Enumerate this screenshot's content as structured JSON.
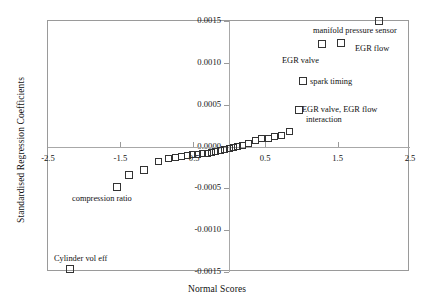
{
  "chart_data": {
    "type": "scatter",
    "title": "",
    "xlabel": "Normal Scores",
    "ylabel": "Standardised Regression Coefficients",
    "xlim": [
      -2.5,
      2.5
    ],
    "ylim": [
      -0.0015,
      0.0015
    ],
    "xticks": [
      "-2.5",
      "-1.5",
      "-0.5",
      "0.5",
      "1.5",
      "2.5"
    ],
    "xtick_values": [
      -2.5,
      -1.5,
      -0.5,
      0.5,
      1.5,
      2.5
    ],
    "yticks": [
      "0.0015",
      "0.0010",
      "0.0005",
      "0.0000",
      "-0.0005",
      "-0.0010",
      "-0.0015"
    ],
    "ytick_values": [
      0.0015,
      0.001,
      0.0005,
      0.0,
      -0.0005,
      -0.001,
      -0.0015
    ],
    "grid": false,
    "legend": "none",
    "marker": "open-square",
    "points": [
      {
        "x": -2.2,
        "y": -0.00147,
        "label": "Cylinder vol eff"
      },
      {
        "x": -1.55,
        "y": -0.00049,
        "label": "compression ratio"
      },
      {
        "x": -1.38,
        "y": -0.00034,
        "label": ""
      },
      {
        "x": -1.18,
        "y": -0.00028,
        "label": ""
      },
      {
        "x": -0.98,
        "y": -0.00018,
        "label": ""
      },
      {
        "x": -0.84,
        "y": -0.00014,
        "label": ""
      },
      {
        "x": -0.74,
        "y": -0.00013,
        "label": ""
      },
      {
        "x": -0.66,
        "y": -0.00012,
        "label": ""
      },
      {
        "x": -0.58,
        "y": -0.00011,
        "label": ""
      },
      {
        "x": -0.5,
        "y": -0.0001,
        "label": ""
      },
      {
        "x": -0.43,
        "y": -9e-05,
        "label": ""
      },
      {
        "x": -0.36,
        "y": -8e-05,
        "label": ""
      },
      {
        "x": -0.3,
        "y": -8e-05,
        "label": ""
      },
      {
        "x": -0.24,
        "y": -7e-05,
        "label": ""
      },
      {
        "x": -0.18,
        "y": -6e-05,
        "label": ""
      },
      {
        "x": -0.12,
        "y": -5e-05,
        "label": ""
      },
      {
        "x": -0.06,
        "y": -4e-05,
        "label": ""
      },
      {
        "x": 0.0,
        "y": -2e-05,
        "label": ""
      },
      {
        "x": 0.06,
        "y": -1e-05,
        "label": ""
      },
      {
        "x": 0.12,
        "y": 0.0,
        "label": ""
      },
      {
        "x": 0.19,
        "y": 1e-05,
        "label": ""
      },
      {
        "x": 0.27,
        "y": 4e-05,
        "label": ""
      },
      {
        "x": 0.36,
        "y": 7e-05,
        "label": ""
      },
      {
        "x": 0.45,
        "y": 9e-05,
        "label": ""
      },
      {
        "x": 0.54,
        "y": 0.0001,
        "label": ""
      },
      {
        "x": 0.63,
        "y": 0.00012,
        "label": ""
      },
      {
        "x": 0.72,
        "y": 0.00013,
        "label": ""
      },
      {
        "x": 0.84,
        "y": 0.00018,
        "label": ""
      },
      {
        "x": 0.96,
        "y": 0.00044,
        "label": "EGR valve, EGR flow interaction"
      },
      {
        "x": 1.02,
        "y": 0.00078,
        "label": "spark timing"
      },
      {
        "x": 1.28,
        "y": 0.00122,
        "label": "EGR valve"
      },
      {
        "x": 1.55,
        "y": 0.00124,
        "label": "EGR flow"
      },
      {
        "x": 2.07,
        "y": 0.0015,
        "label": "manifold pressure sensor"
      }
    ],
    "annotations": [
      {
        "text": "manifold pressure sensor",
        "x": 2.07,
        "y": 0.0015
      },
      {
        "text": "EGR flow",
        "x": 1.55,
        "y": 0.00124
      },
      {
        "text": "EGR valve",
        "x": 1.28,
        "y": 0.00122
      },
      {
        "text": "spark timing",
        "x": 1.02,
        "y": 0.00078
      },
      {
        "text": "EGR valve, EGR flow interaction",
        "x": 0.96,
        "y": 0.00044
      },
      {
        "text": "compression ratio",
        "x": -1.55,
        "y": -0.00049
      },
      {
        "text": "Cylinder vol eff",
        "x": -2.2,
        "y": -0.00147
      }
    ]
  },
  "labels": {
    "ylabel": "Standardised Regression Coefficients",
    "xlabel": "Normal Scores",
    "ann_manifold": "manifold pressure sensor",
    "ann_egr_flow": "EGR flow",
    "ann_egr_valve": "EGR valve",
    "ann_spark": "spark timing",
    "ann_interaction_line1": "EGR valve, EGR flow",
    "ann_interaction_line2": "interaction",
    "ann_compression": "compression ratio",
    "ann_cylinder": "Cylinder vol eff"
  },
  "colors": {
    "marker_stroke": "#333333",
    "axis": "#9a9a9a",
    "text": "#111111",
    "background": "#ffffff"
  }
}
